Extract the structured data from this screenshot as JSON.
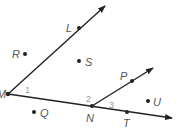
{
  "diagram": {
    "type": "geometry-rays-and-angles",
    "line_color": "#222222",
    "point_labels": {
      "M": "M",
      "L": "L",
      "R": "R",
      "S": "S",
      "P": "P",
      "N": "N",
      "T": "T",
      "U": "U",
      "Q": "Q"
    },
    "angle_labels": {
      "a1": "1",
      "a2": "2",
      "a3": "3"
    },
    "rays": [
      {
        "from": "M",
        "through": "L"
      },
      {
        "from": "M",
        "through": "N",
        "continues_through": "T"
      },
      {
        "from": "N",
        "through": "P"
      }
    ],
    "points_off_lines": [
      "R",
      "S",
      "U",
      "Q"
    ]
  }
}
